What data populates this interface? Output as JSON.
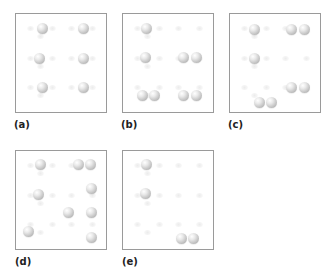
{
  "figure": {
    "panels": [
      {
        "id": "a",
        "label": "(a)",
        "box": {
          "x": 15,
          "y": 13
        },
        "label_pos": {
          "x": 14,
          "y": 119
        },
        "spheres": [
          [
            26,
            14
          ],
          [
            67,
            14
          ],
          [
            23,
            44
          ],
          [
            67,
            44
          ],
          [
            26,
            73
          ],
          [
            67,
            73
          ]
        ]
      },
      {
        "id": "b",
        "label": "(b)",
        "box": {
          "x": 122,
          "y": 13
        },
        "label_pos": {
          "x": 121,
          "y": 119
        },
        "spheres": [
          [
            23,
            14
          ],
          [
            22,
            43
          ],
          [
            60,
            43
          ],
          [
            73,
            43
          ],
          [
            19,
            81
          ],
          [
            31,
            81
          ],
          [
            60,
            81
          ],
          [
            73,
            81
          ]
        ]
      },
      {
        "id": "c",
        "label": "(c)",
        "box": {
          "x": 229,
          "y": 13
        },
        "label_pos": {
          "x": 228,
          "y": 119
        },
        "spheres": [
          [
            24,
            15
          ],
          [
            61,
            15
          ],
          [
            74,
            15
          ],
          [
            24,
            44
          ],
          [
            61,
            73
          ],
          [
            74,
            73
          ],
          [
            29,
            88
          ],
          [
            41,
            88
          ]
        ]
      },
      {
        "id": "d",
        "label": "(d)",
        "box": {
          "x": 15,
          "y": 150
        },
        "label_pos": {
          "x": 15,
          "y": 256
        },
        "spheres": [
          [
            24,
            13
          ],
          [
            62,
            13
          ],
          [
            74,
            13
          ],
          [
            22,
            43
          ],
          [
            75,
            37
          ],
          [
            52,
            61
          ],
          [
            75,
            61
          ],
          [
            12,
            80
          ],
          [
            75,
            86
          ]
        ]
      },
      {
        "id": "e",
        "label": "(e)",
        "box": {
          "x": 122,
          "y": 150
        },
        "label_pos": {
          "x": 122,
          "y": 256
        },
        "spheres": [
          [
            23,
            13
          ],
          [
            22,
            42
          ],
          [
            58,
            87
          ],
          [
            70,
            87
          ]
        ]
      }
    ],
    "ghost_sites": [
      [
        14,
        14
      ],
      [
        36,
        14
      ],
      [
        24,
        22
      ],
      [
        55,
        14
      ],
      [
        76,
        14
      ],
      [
        14,
        44
      ],
      [
        36,
        44
      ],
      [
        24,
        52
      ],
      [
        55,
        44
      ],
      [
        76,
        44
      ],
      [
        14,
        73
      ],
      [
        36,
        73
      ],
      [
        24,
        81
      ],
      [
        55,
        73
      ],
      [
        76,
        73
      ]
    ],
    "colors": {
      "border": "#9a9a9a",
      "sphere_highlight": "#ffffff",
      "sphere_shadow": "#9e9e9e",
      "ghost": "#ececec",
      "label": "#222222"
    }
  }
}
